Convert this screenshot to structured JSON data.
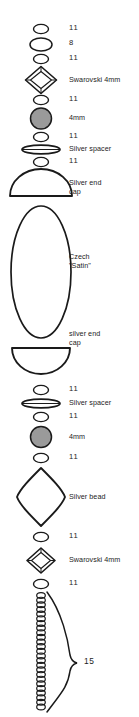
{
  "diagram": {
    "canvas": {
      "width": 139,
      "height": 717
    },
    "colors": {
      "outline": "#1a1a1a",
      "bead_fill_gray": "#9a9a9a",
      "background": "#ffffff",
      "text": "#1c1c1c"
    },
    "components": [
      {
        "id": "seed-11-top-1",
        "shape": "small-oval",
        "label": "11",
        "label_kind": "size-code"
      },
      {
        "id": "seed-8-top",
        "shape": "medium-oval",
        "label": "8",
        "label_kind": "size-code"
      },
      {
        "id": "seed-11-top-2",
        "shape": "small-oval",
        "label": "11",
        "label_kind": "size-code"
      },
      {
        "id": "swarovski-top",
        "shape": "bicone",
        "label": "Swarovski 4mm",
        "label_kind": "name"
      },
      {
        "id": "seed-11-top-3",
        "shape": "small-oval",
        "label": "11",
        "label_kind": "size-code"
      },
      {
        "id": "round-4mm-top",
        "shape": "round-gray",
        "label": "4mm",
        "label_kind": "name"
      },
      {
        "id": "seed-11-top-4",
        "shape": "small-oval",
        "label": "11",
        "label_kind": "size-code"
      },
      {
        "id": "spacer-top",
        "shape": "flat-disc",
        "label": "Silver spacer",
        "label_kind": "name"
      },
      {
        "id": "seed-11-top-5",
        "shape": "small-oval",
        "label": "11",
        "label_kind": "size-code"
      },
      {
        "id": "endcap-top",
        "shape": "dome-up",
        "label": "Silver end\ncap",
        "label_kind": "name"
      },
      {
        "id": "czech-satin",
        "shape": "large-oval",
        "label": "Czech\n\"Satin\"",
        "label_kind": "name"
      },
      {
        "id": "endcap-bottom",
        "shape": "dome-down",
        "label": "silver end\ncap",
        "label_kind": "name"
      },
      {
        "id": "seed-11-mid-1",
        "shape": "small-oval",
        "label": "11",
        "label_kind": "size-code"
      },
      {
        "id": "spacer-bottom",
        "shape": "flat-disc",
        "label": "Silver spacer",
        "label_kind": "name"
      },
      {
        "id": "seed-11-mid-2",
        "shape": "small-oval",
        "label": "11",
        "label_kind": "size-code"
      },
      {
        "id": "round-4mm-bottom",
        "shape": "round-gray",
        "label": "4mm",
        "label_kind": "name"
      },
      {
        "id": "seed-11-mid-3",
        "shape": "small-oval",
        "label": "11",
        "label_kind": "size-code"
      },
      {
        "id": "silver-bead",
        "shape": "rhombus",
        "label": "Silver bead",
        "label_kind": "name"
      },
      {
        "id": "seed-11-mid-4",
        "shape": "small-oval",
        "label": "11",
        "label_kind": "size-code"
      },
      {
        "id": "swarovski-bottom",
        "shape": "bicone",
        "label": "Swarovski 4mm",
        "label_kind": "name"
      },
      {
        "id": "seed-11-mid-5",
        "shape": "small-oval",
        "label": "11",
        "label_kind": "size-code"
      }
    ],
    "fringe": {
      "id": "seed-fringe-column",
      "description": "vertical column of size 15 seed beads",
      "bead_count": 25,
      "brace_label": "15",
      "brace_label_kind": "brace-count"
    },
    "labels": {
      "size_11": "11",
      "size_8": "8",
      "size_15": "15",
      "swarovski_4mm": "Swarovski 4mm",
      "round_4mm": "4mm",
      "silver_spacer": "Silver spacer",
      "silver_end_cap_upper": "Silver end\ncap",
      "czech_satin": "Czech\n\"Satin\"",
      "silver_end_cap_lower": "silver end\ncap",
      "silver_bead": "Silver bead"
    }
  }
}
